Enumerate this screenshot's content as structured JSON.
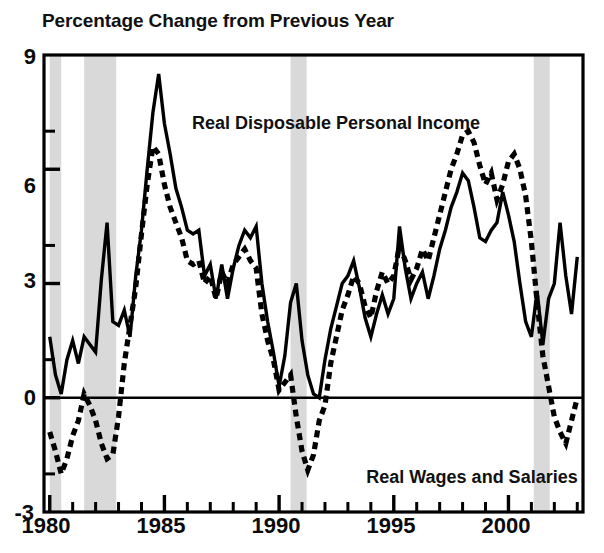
{
  "chart_data": {
    "type": "line",
    "title": "Percentage Change from Previous Year",
    "xlabel": "",
    "ylabel": "",
    "xlim": [
      1979.75,
      2003.25
    ],
    "ylim": [
      -3,
      9
    ],
    "yticks": [
      -3,
      0,
      3,
      6,
      9
    ],
    "ytick_labels": [
      "-3",
      "0",
      "3",
      "6",
      "9"
    ],
    "yminor_ticks": [
      -2,
      -1,
      1,
      2,
      4,
      5,
      7,
      8
    ],
    "xticks": [
      1980,
      1985,
      1990,
      1995,
      2000
    ],
    "xtick_labels": [
      "1980",
      "1985",
      "1990",
      "1995",
      "2000"
    ],
    "xminor_ticks": [
      1981,
      1982,
      1983,
      1984,
      1986,
      1987,
      1988,
      1989,
      1991,
      1992,
      1993,
      1994,
      1996,
      1997,
      1998,
      1999,
      2001,
      2002,
      2003
    ],
    "grid": false,
    "legend_position": "inline-annotations",
    "zero_line": 0,
    "shaded_bands_label": "recession",
    "shaded_bands": [
      {
        "start": 1980.0,
        "end": 1980.5
      },
      {
        "start": 1981.5,
        "end": 1982.9
      },
      {
        "start": 1990.5,
        "end": 1991.2
      },
      {
        "start": 2001.1,
        "end": 2001.8
      }
    ],
    "shaded_band_color": "#d9d9d9",
    "series": [
      {
        "name": "Real Disposable Personal Income",
        "style": "solid",
        "color": "#000000",
        "x": [
          1980.0,
          1980.25,
          1980.5,
          1980.75,
          1981.0,
          1981.25,
          1981.5,
          1981.75,
          1982.0,
          1982.25,
          1982.5,
          1982.75,
          1983.0,
          1983.25,
          1983.5,
          1983.75,
          1984.0,
          1984.25,
          1984.5,
          1984.75,
          1985.0,
          1985.25,
          1985.5,
          1985.75,
          1986.0,
          1986.25,
          1986.5,
          1986.75,
          1987.0,
          1987.25,
          1987.5,
          1987.75,
          1988.0,
          1988.25,
          1988.5,
          1988.75,
          1989.0,
          1989.25,
          1989.5,
          1989.75,
          1990.0,
          1990.25,
          1990.5,
          1990.75,
          1991.0,
          1991.25,
          1991.5,
          1991.75,
          1992.0,
          1992.25,
          1992.5,
          1992.75,
          1993.0,
          1993.25,
          1993.5,
          1993.75,
          1994.0,
          1994.25,
          1994.5,
          1994.75,
          1995.0,
          1995.25,
          1995.5,
          1995.75,
          1996.0,
          1996.25,
          1996.5,
          1996.75,
          1997.0,
          1997.25,
          1997.5,
          1997.75,
          1998.0,
          1998.25,
          1998.5,
          1998.75,
          1999.0,
          1999.25,
          1999.5,
          1999.75,
          2000.0,
          2000.25,
          2000.5,
          2000.75,
          2001.0,
          2001.25,
          2001.5,
          2001.75,
          2002.0,
          2002.25,
          2002.5,
          2002.75,
          2003.0
        ],
        "values": [
          1.6,
          0.6,
          0.1,
          1.0,
          1.5,
          0.9,
          1.6,
          1.4,
          1.2,
          3.1,
          4.6,
          2.0,
          1.9,
          2.3,
          1.6,
          3.2,
          1.0,
          0.7,
          1.6,
          2.4,
          3.6,
          5.0,
          6.5,
          8.5,
          7.6,
          6.2,
          5.3,
          5.0,
          4.6,
          4.3,
          4.3,
          3.8,
          3.9,
          3.3,
          4.2,
          3.4,
          4.1,
          3.5,
          3.4,
          3.4,
          3.6,
          4.1,
          4.8,
          3.7,
          3.0,
          2.6,
          1.5,
          0.6,
          2.7,
          2.9,
          2.5,
          2.2,
          2.9,
          2.8,
          0.4,
          0.0,
          0.2,
          0.9,
          1.4,
          1.9,
          2.5,
          3.1,
          3.6,
          2.2,
          2.2,
          3.0,
          2.1,
          2.2,
          2.7,
          3.1,
          3.5,
          4.5,
          3.3,
          2.8,
          2.4,
          2.9,
          2.4,
          2.8,
          3.3,
          3.6,
          3.9,
          5.2,
          5.9,
          5.8,
          5.4,
          4.5,
          3.4,
          2.3,
          3.0,
          4.5,
          5.5,
          3.2,
          1.2
        ],
        "values_corrected": [
          1.6,
          0.6,
          0.1,
          1.0,
          1.5,
          0.9,
          1.6,
          1.4,
          1.2,
          3.1,
          4.6,
          2.0,
          1.9,
          2.3,
          1.6,
          3.2,
          4.4,
          6.0,
          7.5,
          8.5,
          7.2,
          6.4,
          5.5,
          5.0,
          4.4,
          4.3,
          4.4,
          3.2,
          3.5,
          2.6,
          3.5,
          2.6,
          3.4,
          4.0,
          4.4,
          4.2,
          4.5,
          3.0,
          2.0,
          1.2,
          0.3,
          1.1,
          2.5,
          3.0,
          1.5,
          0.6,
          0.1,
          0.0,
          1.0,
          1.8,
          2.4,
          3.0,
          3.2,
          3.6,
          2.9,
          2.1,
          1.6,
          2.2,
          2.7,
          2.2,
          2.6,
          4.5,
          3.4,
          2.6,
          3.0,
          3.3,
          2.6,
          3.2,
          3.9,
          4.4,
          5.0,
          5.4,
          5.9,
          5.7,
          5.0,
          4.2,
          4.1,
          4.4,
          4.6,
          5.4,
          4.8,
          4.1,
          3.0,
          2.0,
          1.6,
          2.8,
          1.4,
          2.6,
          3.0,
          4.6,
          3.2,
          2.2,
          3.7
        ]
      },
      {
        "name": "Real Wages and Salaries",
        "style": "dashed",
        "color": "#000000",
        "x": [
          1980.0,
          1980.25,
          1980.5,
          1980.75,
          1981.0,
          1981.25,
          1981.5,
          1981.75,
          1982.0,
          1982.25,
          1982.5,
          1982.75,
          1983.0,
          1983.25,
          1983.5,
          1983.75,
          1984.0,
          1984.25,
          1984.5,
          1984.75,
          1985.0,
          1985.25,
          1985.5,
          1985.75,
          1986.0,
          1986.25,
          1986.5,
          1986.75,
          1987.0,
          1987.25,
          1987.5,
          1987.75,
          1988.0,
          1988.25,
          1988.5,
          1988.75,
          1989.0,
          1989.25,
          1989.5,
          1989.75,
          1990.0,
          1990.25,
          1990.5,
          1990.75,
          1991.0,
          1991.25,
          1991.5,
          1991.75,
          1992.0,
          1992.25,
          1992.5,
          1992.75,
          1993.0,
          1993.25,
          1993.5,
          1993.75,
          1994.0,
          1994.25,
          1994.5,
          1994.75,
          1995.0,
          1995.25,
          1995.5,
          1995.75,
          1996.0,
          1996.25,
          1996.5,
          1996.75,
          1997.0,
          1997.25,
          1997.5,
          1997.75,
          1998.0,
          1998.25,
          1998.5,
          1998.75,
          1999.0,
          1999.25,
          1999.5,
          1999.75,
          2000.0,
          2000.25,
          2000.5,
          2000.75,
          2001.0,
          2001.25,
          2001.5,
          2001.75,
          2002.0,
          2002.25,
          2002.5,
          2002.75,
          2003.0
        ],
        "values": [
          -0.9,
          -1.4,
          -2.0,
          -1.6,
          -1.0,
          -0.6,
          0.1,
          -0.2,
          -0.6,
          -1.2,
          -1.6,
          -1.5,
          -0.5,
          0.9,
          1.9,
          2.9,
          4.3,
          5.6,
          6.6,
          6.4,
          5.6,
          5.0,
          4.6,
          4.2,
          3.6,
          3.5,
          3.6,
          3.0,
          3.2,
          2.6,
          3.3,
          3.0,
          3.5,
          3.7,
          3.9,
          3.6,
          3.4,
          2.2,
          1.5,
          1.0,
          0.2,
          0.4,
          0.6,
          -0.5,
          -1.4,
          -1.9,
          -1.5,
          -0.6,
          -0.2,
          0.9,
          1.6,
          2.3,
          2.7,
          3.2,
          3.0,
          2.4,
          2.1,
          2.8,
          3.3,
          3.0,
          3.2,
          4.0,
          3.6,
          3.1,
          3.4,
          3.9,
          3.6,
          4.2,
          4.8,
          5.4,
          6.0,
          6.4,
          6.9,
          7.0,
          6.7,
          6.1,
          5.6,
          5.9,
          5.2,
          5.6,
          6.2,
          6.4,
          6.0,
          5.3,
          4.1,
          2.5,
          1.1,
          0.3,
          -0.5,
          -0.9,
          -1.2,
          -0.6,
          0.0
        ]
      }
    ],
    "annotations": [
      {
        "text": "Real Disposable Personal Income",
        "x": 1986.2,
        "y": 7.2
      },
      {
        "text": "Real Wages and Salaries",
        "x": 1993.8,
        "y": -2.1
      }
    ]
  },
  "axes": {
    "frame_color": "#000000",
    "zero_line_color": "#000000"
  }
}
